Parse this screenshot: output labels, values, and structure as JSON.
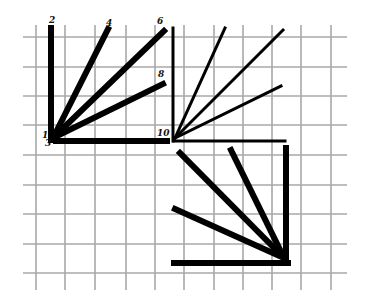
{
  "diagram": {
    "type": "stroke-order grid",
    "grid": {
      "color": "#a8a8a8",
      "vertical_x": [
        36,
        65,
        95,
        126,
        155,
        184,
        214,
        243,
        272,
        301,
        331
      ],
      "horizontal_y": [
        37,
        67,
        96,
        125,
        155,
        185,
        214,
        244,
        273
      ],
      "x_extent": [
        23,
        347
      ],
      "y_extent": [
        25,
        290
      ]
    },
    "labels": [
      {
        "text": "2",
        "x": 49,
        "y": 23
      },
      {
        "text": "4",
        "x": 106,
        "y": 26
      },
      {
        "text": "6",
        "x": 157,
        "y": 24
      },
      {
        "text": "8",
        "x": 158,
        "y": 77
      },
      {
        "text": "1",
        "x": 42,
        "y": 138
      },
      {
        "text": "3",
        "x": 45,
        "y": 146
      },
      {
        "text": "10",
        "x": 157,
        "y": 136
      }
    ],
    "figures": [
      {
        "name": "fan-top-left-thick",
        "stroke": "#000000",
        "width": 6,
        "lines": [
          [
            51,
            28,
            51,
            140
          ],
          [
            53,
            138,
            108,
            29
          ],
          [
            53,
            138,
            164,
            31
          ],
          [
            53,
            138,
            163,
            84
          ],
          [
            56,
            141,
            167,
            141
          ]
        ]
      },
      {
        "name": "fan-top-right-thin",
        "stroke": "#000000",
        "width": 3,
        "lines": [
          [
            173,
            28,
            173,
            141
          ],
          [
            175,
            138,
            225,
            28
          ],
          [
            175,
            138,
            283,
            30
          ],
          [
            175,
            138,
            281,
            86
          ],
          [
            174,
            141,
            285,
            141
          ]
        ]
      },
      {
        "name": "fan-bottom-right-thick",
        "stroke": "#000000",
        "width": 6,
        "lines": [
          [
            286,
            148,
            286,
            263
          ],
          [
            284,
            258,
            180,
            153
          ],
          [
            284,
            258,
            231,
            150
          ],
          [
            284,
            258,
            175,
            209
          ],
          [
            174,
            263,
            288,
            263
          ]
        ]
      }
    ]
  }
}
